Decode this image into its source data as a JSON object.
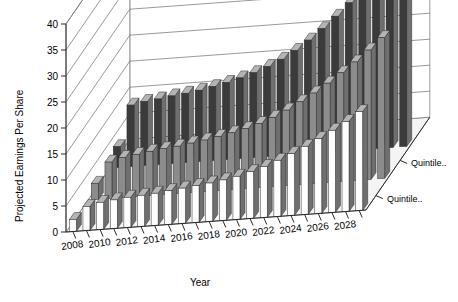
{
  "chart_data": {
    "type": "bar",
    "subtype": "3d-grouped-bar",
    "title": "",
    "xlabel": "Year",
    "ylabel": "Projected Earnings Per Share",
    "ylim": [
      0,
      40
    ],
    "ytick_step": 5,
    "yticks": [
      0,
      5,
      10,
      15,
      20,
      25,
      30,
      35,
      40
    ],
    "grid": true,
    "legend_position": "right-bottom",
    "categories": [
      "2008",
      "2009",
      "2010",
      "2011",
      "2012",
      "2013",
      "2014",
      "2015",
      "2016",
      "2017",
      "2018",
      "2019",
      "2020",
      "2021",
      "2022",
      "2023",
      "2024",
      "2025",
      "2026",
      "2027",
      "2028",
      "2029"
    ],
    "xtick_labels": [
      "2008",
      "2010",
      "2012",
      "2014",
      "2016",
      "2018",
      "2020",
      "2022",
      "2024",
      "2026",
      "2028"
    ],
    "series": [
      {
        "name": "Quintile..",
        "row": "front",
        "color": "#fdfdfd",
        "values": [
          2.3,
          4.6,
          5.2,
          5.5,
          5.8,
          6.0,
          6.2,
          6.5,
          6.8,
          7.1,
          7.4,
          7.8,
          8.3,
          9.0,
          9.8,
          10.8,
          11.9,
          13.1,
          14.4,
          15.8,
          17.3,
          19.0
        ]
      },
      {
        "name": "Quintile..",
        "row": "middle",
        "color": "#8c8c8c",
        "values": [
          3.1,
          7.0,
          7.7,
          8.1,
          8.5,
          8.8,
          9.1,
          9.5,
          9.9,
          10.4,
          10.9,
          11.5,
          12.3,
          13.3,
          14.5,
          15.9,
          17.4,
          19.1,
          20.9,
          22.8,
          24.9,
          27.1
        ]
      },
      {
        "name": "Quintile..",
        "row": "back",
        "color": "#3b3b3b",
        "values": [
          4.0,
          11.8,
          12.3,
          12.6,
          13.0,
          13.3,
          13.7,
          14.2,
          14.8,
          15.5,
          16.3,
          17.3,
          18.5,
          20.0,
          21.8,
          23.8,
          26.0,
          28.4,
          31.0,
          33.7,
          36.0,
          38.0
        ]
      }
    ],
    "legend": [
      {
        "label": "Quintile..",
        "color": "#3b3b3b"
      },
      {
        "label": "Quintile..",
        "color": "#8c8c8c"
      }
    ]
  }
}
